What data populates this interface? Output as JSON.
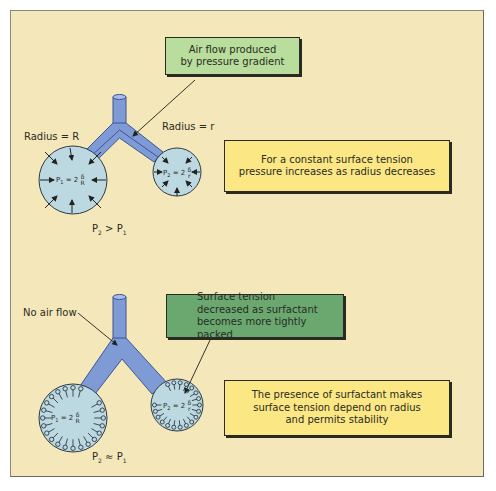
{
  "colors": {
    "background": "#f4e7b9",
    "airway": "#7f9bd6",
    "airway_edge": "#3d5494",
    "alveolus": "#bcd9e2",
    "alveolus_edge": "#2f3a44",
    "box_light_green": "#b9dd9c",
    "box_dark_green": "#6aa870",
    "box_yellow": "#fbe783",
    "text": "#2b2b24"
  },
  "top_panel": {
    "callout_airflow": {
      "line1": "Air flow produced",
      "line2": "by pressure gradient"
    },
    "label_radius_large": "Radius = R",
    "label_radius_small": "Radius = r",
    "equation_large": {
      "lhs": "P",
      "sub": "1",
      "rhs": "= 2",
      "num": "δ",
      "den": "R"
    },
    "equation_small": {
      "lhs": "P",
      "sub": "2",
      "rhs": "= 2",
      "num": "δ",
      "den": "r"
    },
    "info_box": {
      "line1": "For a constant surface tension",
      "line2": "pressure increases as radius decreases"
    },
    "relation": {
      "left": "P",
      "left_sub": "2",
      "op": ">",
      "right": "P",
      "right_sub": "1"
    }
  },
  "bottom_panel": {
    "label_no_airflow": "No air flow",
    "callout_surfactant": {
      "line1": "Surface tension",
      "line2": "decreased as surfactant",
      "line3": "becomes more tightly packed"
    },
    "equation_large": {
      "lhs": "P",
      "sub": "1",
      "rhs": "= 2",
      "num": "δ",
      "den": "R"
    },
    "equation_small": {
      "lhs": "P",
      "sub": "2",
      "rhs": "= 2",
      "num": "δ",
      "den": "r"
    },
    "info_box": {
      "line1": "The presence of surfactant makes",
      "line2": "surface tension depend on radius",
      "line3": "and permits stability"
    },
    "relation": {
      "left": "P",
      "left_sub": "2",
      "op": "≈",
      "right": "P",
      "right_sub": "1"
    }
  }
}
